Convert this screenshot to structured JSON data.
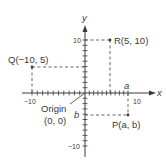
{
  "diagram": {
    "type": "coordinate-plane",
    "axes": {
      "x_label": "x",
      "y_label": "y",
      "x_range": [
        -10,
        10
      ],
      "y_range": [
        -10,
        10
      ],
      "tick_step": 1,
      "x_tick_labels": [
        "−10",
        "10"
      ],
      "y_tick_labels": [
        "10",
        "−10"
      ]
    },
    "origin": {
      "label_line1": "Origin",
      "label_line2": "(0, 0)"
    },
    "points": [
      {
        "id": "Q",
        "label": "Q(−10, 5)",
        "x": -10,
        "y": 5
      },
      {
        "id": "R",
        "label": "R(5, 10)",
        "x": 5,
        "y": 10
      },
      {
        "id": "P",
        "label": "P(a, b)",
        "x": "a",
        "y": "b",
        "approx_x": 8.5,
        "approx_y": -4
      }
    ],
    "axis_markers": {
      "a_label": "a",
      "b_label": "b"
    },
    "colors": {
      "ink": "#3a3a3a",
      "dash": "#555555",
      "background": "#ffffff"
    }
  }
}
